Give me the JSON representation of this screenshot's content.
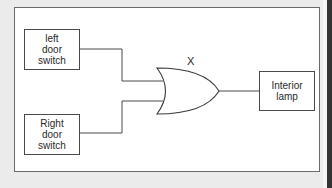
{
  "diagram": {
    "type": "logic-circuit",
    "gate": {
      "type": "OR",
      "label": "X"
    },
    "inputs": [
      {
        "id": "left",
        "lines": [
          "left",
          "door",
          "switch"
        ]
      },
      {
        "id": "right",
        "lines": [
          "Right",
          "door",
          "switch"
        ]
      }
    ],
    "output": {
      "lines": [
        "Interior",
        "lamp"
      ]
    },
    "colors": {
      "background": "#ebebeb",
      "frame": "#ffffff",
      "line": "#4a4a4a",
      "text": "#2a2a2a"
    }
  }
}
